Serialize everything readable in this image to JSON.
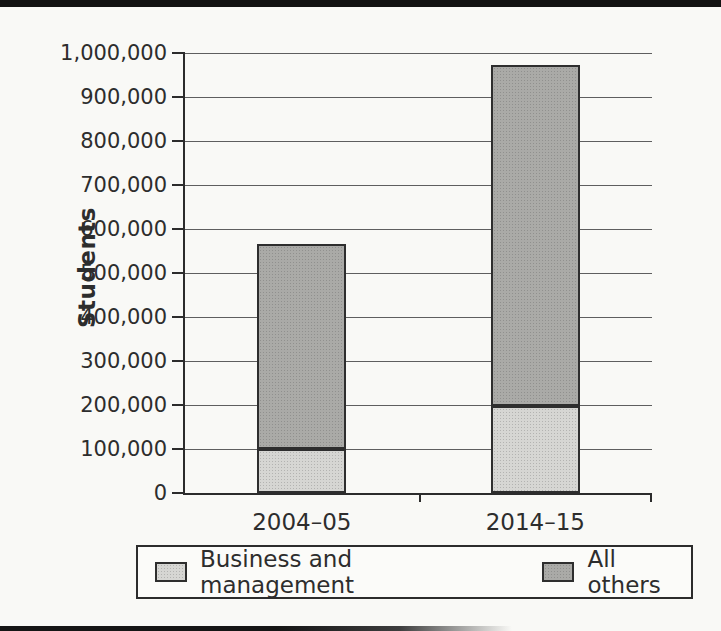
{
  "page": {
    "background": "#f9f9f6",
    "scan_artifacts": {
      "top_edge_bar_color": "#131313",
      "bottom_edge_bar_color": "#151515"
    }
  },
  "chart_data": {
    "type": "bar",
    "stacked": true,
    "title": "",
    "ylabel": "Students",
    "xlabel": "",
    "categories": [
      "2004–05",
      "2014–15"
    ],
    "series": [
      {
        "name": "Business and management",
        "values": [
          101000,
          197000
        ],
        "color": "#d6d6d3"
      },
      {
        "name": "All others",
        "values": [
          464000,
          775000
        ],
        "color": "#aaaaa7"
      }
    ],
    "stack_totals": [
      565000,
      972000
    ],
    "ylim": [
      0,
      1000000
    ],
    "ytick_step": 100000,
    "ytick_labels": [
      "0",
      "100,000",
      "200,000",
      "300,000",
      "400,000",
      "500,000",
      "600,000",
      "700,000",
      "800,000",
      "900,000",
      "1,000,000"
    ],
    "grid": true,
    "legend_position": "bottom",
    "axis_color": "#2c2c2c",
    "gridline_color": "#5f5f5f",
    "text_color": "#2d2d2d"
  }
}
